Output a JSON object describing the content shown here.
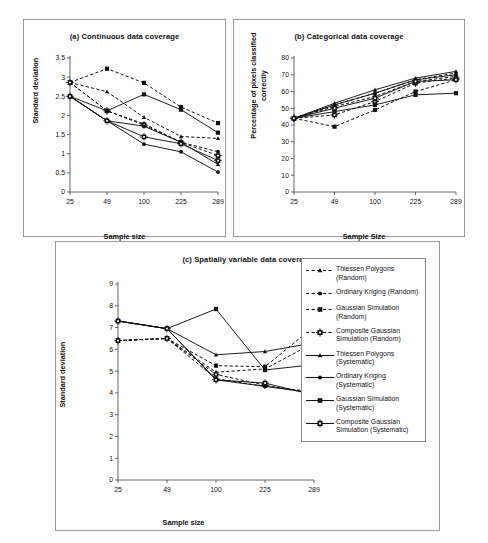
{
  "figure": {
    "panels": [
      {
        "id": "a",
        "title": "(a) Continuous data coverage"
      },
      {
        "id": "b",
        "title": "(b) Categorical data coverage"
      },
      {
        "id": "c",
        "title": "(c) Spatially variable data coverage"
      }
    ]
  },
  "legend": {
    "entries": [
      {
        "label": "Thiessen Polygons (Random)",
        "marker": "triangle",
        "line": "dashed"
      },
      {
        "label": "Ordinary Kriging (Random)",
        "marker": "circle",
        "line": "dashed"
      },
      {
        "label": "Gaussian Simulation (Random)",
        "marker": "square",
        "line": "dashed"
      },
      {
        "label": "Composite Gaussian Simulation (Random)",
        "marker": "crossed-square",
        "line": "dashed"
      },
      {
        "label": "Thiessen Polygons (Systematic)",
        "marker": "triangle",
        "line": "solid"
      },
      {
        "label": "Ordinary Kriging (Systematic)",
        "marker": "circle",
        "line": "solid"
      },
      {
        "label": "Gaussian Simulation (Systematic)",
        "marker": "square",
        "line": "solid"
      },
      {
        "label": "Composite Gaussian Simulation (Systematic)",
        "marker": "crossed-square",
        "line": "solid"
      }
    ]
  },
  "chart_data": [
    {
      "id": "a",
      "type": "line",
      "title": "(a) Continuous data coverage",
      "xlabel": "Sample size",
      "ylabel": "Standard deviation",
      "categories": [
        "25",
        "49",
        "100",
        "225",
        "289"
      ],
      "ylim": [
        0,
        3.5
      ],
      "yticks": [
        0,
        0.5,
        1,
        1.5,
        2,
        2.5,
        3,
        3.5
      ],
      "ytick_labels": [
        "0",
        "0.5",
        "1",
        "1.5",
        "2",
        "2.5",
        "3",
        "3.5"
      ],
      "grid": false,
      "legend_position": "external-right",
      "series": [
        {
          "name": "Thiessen Polygons (Random)",
          "marker": "triangle",
          "line": "dashed",
          "values": [
            2.86,
            2.62,
            1.95,
            1.45,
            1.4
          ]
        },
        {
          "name": "Ordinary Kriging (Random)",
          "marker": "circle",
          "line": "dashed",
          "values": [
            2.86,
            2.12,
            1.78,
            1.3,
            1.05
          ]
        },
        {
          "name": "Gaussian Simulation (Random)",
          "marker": "square",
          "line": "dashed",
          "values": [
            2.86,
            3.22,
            2.85,
            2.22,
            1.8
          ]
        },
        {
          "name": "Composite Gaussian Simulation (Random)",
          "marker": "crossed-square",
          "line": "dashed",
          "values": [
            2.86,
            2.12,
            1.75,
            1.3,
            0.95
          ]
        },
        {
          "name": "Thiessen Polygons (Systematic)",
          "marker": "triangle",
          "line": "solid",
          "values": [
            2.5,
            1.86,
            1.72,
            1.3,
            0.72
          ]
        },
        {
          "name": "Ordinary Kriging (Systematic)",
          "marker": "circle",
          "line": "solid",
          "values": [
            2.5,
            1.86,
            1.25,
            1.05,
            0.52
          ]
        },
        {
          "name": "Gaussian Simulation (Systematic)",
          "marker": "square",
          "line": "solid",
          "values": [
            2.5,
            2.12,
            2.55,
            2.15,
            1.55
          ]
        },
        {
          "name": "Composite Gaussian Simulation (Systematic)",
          "marker": "crossed-square",
          "line": "solid",
          "values": [
            2.5,
            1.86,
            1.44,
            1.26,
            0.82
          ]
        }
      ]
    },
    {
      "id": "b",
      "type": "line",
      "title": "(b) Categorical data coverage",
      "xlabel": "Sample Size",
      "ylabel": "Percentage of pixels classified correctly",
      "categories": [
        "25",
        "49",
        "100",
        "225",
        "289"
      ],
      "ylim": [
        0,
        80
      ],
      "yticks": [
        0,
        10,
        20,
        30,
        40,
        50,
        60,
        70,
        80
      ],
      "ytick_labels": [
        "0",
        "10",
        "20",
        "30",
        "40",
        "50",
        "60",
        "70",
        "80"
      ],
      "grid": false,
      "legend_position": "external-right",
      "series": [
        {
          "name": "Thiessen Polygons (Random)",
          "marker": "triangle",
          "line": "dashed",
          "values": [
            44,
            52,
            59,
            67,
            71
          ]
        },
        {
          "name": "Ordinary Kriging (Random)",
          "marker": "circle",
          "line": "dashed",
          "values": [
            44,
            51,
            57,
            66,
            69
          ]
        },
        {
          "name": "Gaussian Simulation (Random)",
          "marker": "square",
          "line": "dashed",
          "values": [
            44,
            39,
            49,
            60,
            67
          ]
        },
        {
          "name": "Composite Gaussian Simulation (Random)",
          "marker": "crossed-square",
          "line": "dashed",
          "values": [
            44,
            46,
            54,
            65,
            68
          ]
        },
        {
          "name": "Thiessen Polygons (Systematic)",
          "marker": "triangle",
          "line": "solid",
          "values": [
            44,
            53,
            61,
            68,
            72
          ]
        },
        {
          "name": "Ordinary Kriging (Systematic)",
          "marker": "circle",
          "line": "solid",
          "values": [
            44,
            52,
            59,
            67,
            70
          ]
        },
        {
          "name": "Gaussian Simulation (Systematic)",
          "marker": "square",
          "line": "solid",
          "values": [
            44,
            48,
            52,
            58,
            59
          ]
        },
        {
          "name": "Composite Gaussian Simulation (Systematic)",
          "marker": "crossed-square",
          "line": "solid",
          "values": [
            44,
            50,
            56,
            66,
            67
          ]
        }
      ]
    },
    {
      "id": "c",
      "type": "line",
      "title": "(c) Spatially variable data coverage",
      "xlabel": "Sample size",
      "ylabel": "Standard deviation",
      "categories": [
        "25",
        "49",
        "100",
        "225",
        "289"
      ],
      "ylim": [
        0,
        9
      ],
      "yticks": [
        0,
        1,
        2,
        3,
        4,
        5,
        6,
        7,
        8,
        9
      ],
      "ytick_labels": [
        "0",
        "1",
        "2",
        "3",
        "4",
        "5",
        "6",
        "7",
        "8",
        "9"
      ],
      "grid": false,
      "legend_position": "external-right",
      "series": [
        {
          "name": "Thiessen Polygons (Random)",
          "marker": "triangle",
          "line": "dashed",
          "values": [
            6.4,
            6.5,
            4.95,
            5.1,
            6.3
          ]
        },
        {
          "name": "Ordinary Kriging (Random)",
          "marker": "circle",
          "line": "dashed",
          "values": [
            6.4,
            6.5,
            4.65,
            4.3,
            4.05
          ]
        },
        {
          "name": "Gaussian Simulation (Random)",
          "marker": "square",
          "line": "dashed",
          "values": [
            6.4,
            6.5,
            5.25,
            5.2,
            7.05
          ]
        },
        {
          "name": "Composite Gaussian Simulation (Random)",
          "marker": "crossed-square",
          "line": "dashed",
          "values": [
            6.4,
            6.5,
            4.85,
            4.35,
            3.95
          ]
        },
        {
          "name": "Thiessen Polygons (Systematic)",
          "marker": "triangle",
          "line": "solid",
          "values": [
            7.3,
            6.95,
            5.75,
            5.9,
            6.3
          ]
        },
        {
          "name": "Ordinary Kriging (Systematic)",
          "marker": "circle",
          "line": "solid",
          "values": [
            7.3,
            6.95,
            4.6,
            4.3,
            4.0
          ]
        },
        {
          "name": "Gaussian Simulation (Systematic)",
          "marker": "square",
          "line": "solid",
          "values": [
            7.3,
            6.95,
            7.85,
            5.05,
            5.3
          ]
        },
        {
          "name": "Composite Gaussian Simulation (Systematic)",
          "marker": "crossed-square",
          "line": "solid",
          "values": [
            7.3,
            6.95,
            4.6,
            4.45,
            3.9
          ]
        }
      ]
    }
  ]
}
